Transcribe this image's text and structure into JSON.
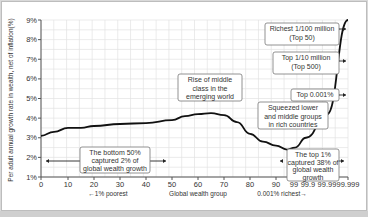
{
  "chart_data": {
    "type": "line",
    "title": "",
    "ylabel": "Per adult annual growth rate in wealth, net of inflation(%)",
    "xlabel": "Global wealth group",
    "xlabel_left": "←1% poorest",
    "xlabel_right": "0.001% richest→",
    "ylim": [
      1,
      9
    ],
    "yticks": [
      "1%",
      "2%",
      "3%",
      "4%",
      "5%",
      "6%",
      "7%",
      "8%",
      "9%"
    ],
    "xticks": [
      "0",
      "10",
      "20",
      "30",
      "40",
      "50",
      "60",
      "70",
      "80",
      "90",
      "99",
      "99.9",
      "99.99",
      "99.999"
    ],
    "grid": true,
    "series": [
      {
        "name": "Per adult wealth growth",
        "x": [
          "0",
          "5",
          "10",
          "15",
          "20",
          "30",
          "40",
          "50",
          "55",
          "60",
          "65",
          "70",
          "75",
          "80",
          "85",
          "90",
          "95",
          "99",
          "99.9",
          "99.99",
          "99.999"
        ],
        "values": [
          3.1,
          3.3,
          3.5,
          3.5,
          3.6,
          3.7,
          3.75,
          3.9,
          4.1,
          4.2,
          4.25,
          4.15,
          3.8,
          3.2,
          2.8,
          2.6,
          2.4,
          2.5,
          3.0,
          4.2,
          9.0
        ]
      }
    ],
    "annotations": [
      {
        "text": "The bottom 50% captured 2% of global wealth growth",
        "range": [
          "0",
          "50"
        ]
      },
      {
        "text": "Rise of middle class in the emerging world"
      },
      {
        "text": "Squeezed lower and middle groups in rich countries"
      },
      {
        "text": "The top 1% captured 38% of global wealth growth",
        "range": [
          "99",
          "99.999"
        ]
      },
      {
        "text": "Top 0.001%"
      },
      {
        "text": "Top 1/10 million (Top 500)"
      },
      {
        "text": "Richest 1/100 million (Top 50)"
      }
    ]
  },
  "labels": {
    "ylabel": "Per adult annual growth rate in wealth, net of inflation(%)",
    "xlabel": "Global wealth group",
    "xlabel_left": "←1% poorest",
    "xlabel_right": "0.001% richest→",
    "bottom_box": [
      "The bottom 50%",
      "captured 2% of",
      "global wealth growth"
    ],
    "middle_box": [
      "Rise of middle",
      "class in the",
      "emerging world"
    ],
    "squeezed_box": [
      "Squeezed lower",
      "and middle groups",
      "in rich countries"
    ],
    "top1_box": [
      "The top 1%",
      "captured 38% of",
      "global wealth",
      "growth"
    ],
    "top0001_box": [
      "Top 0.001%"
    ],
    "top500_box": [
      "Top 1/10 million",
      "(Top 500)"
    ],
    "top50_box": [
      "Richest 1/100 million",
      "(Top 50)"
    ]
  }
}
